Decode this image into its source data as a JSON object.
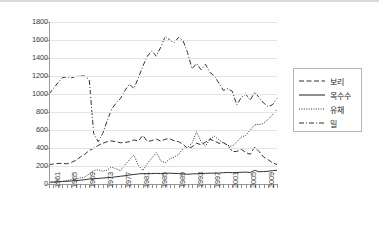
{
  "chart_data": {
    "type": "line",
    "title": "",
    "xlabel": "",
    "ylabel": "",
    "ylim": [
      0,
      1800
    ],
    "ytick_values": [
      0,
      200,
      400,
      600,
      800,
      1000,
      1200,
      1400,
      1600,
      1800
    ],
    "ytick_labels": [
      "0",
      "200",
      "400",
      "600",
      "800",
      "1000",
      "1200",
      "1400",
      "1600",
      "1800"
    ],
    "grid": true,
    "legend_position": "right",
    "x": [
      1961,
      1962,
      1963,
      1964,
      1965,
      1966,
      1967,
      1968,
      1969,
      1970,
      1971,
      1972,
      1973,
      1974,
      1975,
      1976,
      1977,
      1978,
      1979,
      1980,
      1981,
      1982,
      1983,
      1984,
      1985,
      1986,
      1987,
      1988,
      1989,
      1990,
      1991,
      1992,
      1993,
      1994,
      1995,
      1996,
      1997,
      1998,
      1999,
      2000,
      2001,
      2002,
      2003,
      2004,
      2005,
      2006,
      2007,
      2008,
      2009,
      2010,
      2011,
      2012
    ],
    "xtick_labels": [
      "1961",
      "1965",
      "1969",
      "1973",
      "1977",
      "1981",
      "1985",
      "1989",
      "1993",
      "1997",
      "2001",
      "2005",
      "2009"
    ],
    "xtick_label_years": [
      1961,
      1965,
      1969,
      1973,
      1977,
      1981,
      1985,
      1989,
      1993,
      1997,
      2001,
      2005,
      2009
    ],
    "series": [
      {
        "name": "보리",
        "style": "dashed",
        "values": [
          215,
          222,
          228,
          230,
          224,
          240,
          262,
          300,
          330,
          372,
          398,
          428,
          452,
          470,
          478,
          470,
          458,
          462,
          470,
          490,
          478,
          540,
          472,
          482,
          500,
          476,
          498,
          502,
          480,
          470,
          440,
          396,
          412,
          454,
          436,
          464,
          498,
          478,
          452,
          460,
          430,
          360,
          362,
          386,
          350,
          330,
          410,
          360,
          300,
          270,
          235,
          215
        ]
      },
      {
        "name": "옥수수",
        "style": "solid",
        "values": [
          20,
          22,
          24,
          28,
          30,
          34,
          38,
          42,
          48,
          55,
          58,
          62,
          66,
          70,
          74,
          80,
          86,
          92,
          100,
          106,
          112,
          116,
          114,
          116,
          118,
          116,
          118,
          120,
          118,
          116,
          112,
          108,
          112,
          114,
          116,
          118,
          120,
          120,
          122,
          126,
          128,
          126,
          128,
          130,
          132,
          128,
          152,
          136,
          138,
          142,
          148,
          152
        ]
      },
      {
        "name": "유채",
        "style": "dotted",
        "values": [
          18,
          20,
          24,
          30,
          38,
          48,
          56,
          68,
          78,
          112,
          150,
          158,
          142,
          154,
          190,
          168,
          148,
          210,
          270,
          320,
          206,
          150,
          228,
          290,
          348,
          258,
          236,
          278,
          300,
          330,
          392,
          408,
          452,
          580,
          472,
          420,
          502,
          530,
          492,
          456,
          428,
          418,
          468,
          520,
          540,
          600,
          658,
          660,
          672,
          718,
          770,
          830
        ]
      },
      {
        "name": "밀",
        "style": "dashdot",
        "values": [
          1000,
          1062,
          1125,
          1180,
          1192,
          1180,
          1196,
          1202,
          1198,
          1160,
          560,
          470,
          560,
          700,
          830,
          900,
          950,
          1040,
          1110,
          1060,
          1180,
          1310,
          1420,
          1480,
          1420,
          1520,
          1640,
          1600,
          1570,
          1630,
          1590,
          1460,
          1280,
          1340,
          1270,
          1330,
          1240,
          1200,
          1120,
          1040,
          1060,
          1030,
          880,
          960,
          1000,
          930,
          1020,
          960,
          900,
          860,
          880,
          950
        ]
      }
    ]
  },
  "legend": {
    "items": [
      {
        "label": "보리",
        "style": "dashed"
      },
      {
        "label": "옥수수",
        "style": "solid"
      },
      {
        "label": "유채",
        "style": "dotted"
      },
      {
        "label": "밀",
        "style": "dashdot"
      }
    ]
  },
  "colors": {
    "series": "#333333",
    "grid": "#e4e4e4",
    "axis": "#9a9a9a",
    "text": "#3c3c3c",
    "background": "#ffffff"
  }
}
